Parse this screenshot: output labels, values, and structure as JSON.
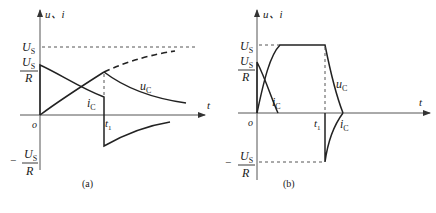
{
  "figure": {
    "panels": [
      {
        "id": "a",
        "caption": "(a)",
        "y_axis_label": "u、i",
        "x_axis_label": "t",
        "origin_label": "o",
        "t1_label": "t",
        "t1_sub": "1",
        "us_label": "U",
        "us_sub": "S",
        "us_r_num": "U",
        "us_r_num_sub": "S",
        "us_r_den": "R",
        "neg_prefix": "−",
        "neg_num": "U",
        "neg_num_sub": "S",
        "neg_den": "R",
        "uc_label": "u",
        "uc_sub": "C",
        "ic_label": "i",
        "ic_sub": "C"
      },
      {
        "id": "b",
        "caption": "(b)",
        "y_axis_label": "u、i",
        "x_axis_label": "t",
        "origin_label": "o",
        "t1_label": "t",
        "t1_sub": "1",
        "us_label": "U",
        "us_sub": "S",
        "us_r_num": "U",
        "us_r_num_sub": "S",
        "us_r_den": "R",
        "neg_prefix": "−",
        "neg_num": "U",
        "neg_num_sub": "S",
        "neg_den": "R",
        "uc_label": "u",
        "uc_sub": "C",
        "ic_label": "i",
        "ic_sub": "C",
        "ic2_label": "i",
        "ic2_sub": "C"
      }
    ]
  },
  "colors": {
    "line": "#222222",
    "axis": "#555555",
    "background": "#ffffff"
  }
}
